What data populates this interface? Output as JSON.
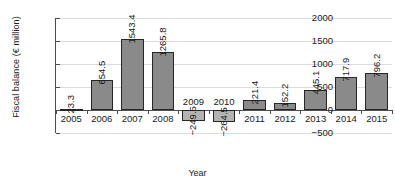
{
  "chart_data": {
    "type": "bar",
    "title": "",
    "xlabel": "Year",
    "ylabel": "Fiscal balance (€ million)",
    "categories": [
      "2005",
      "2006",
      "2007",
      "2008",
      "2009",
      "2010",
      "2011",
      "2012",
      "2013",
      "2014",
      "2015"
    ],
    "values": [
      23.3,
      654.5,
      1543.4,
      1265.8,
      -249.5,
      -264.5,
      221.4,
      152.2,
      445.1,
      717.9,
      796.2
    ],
    "value_labels": [
      "23.3",
      "654.5",
      "1543.4",
      "1265.8",
      "−249.5",
      "−264.5",
      "221.4",
      "152.2",
      "445.1",
      "717.9",
      "796.2"
    ],
    "ylim": [
      -500,
      2000
    ],
    "yticks": [
      2000,
      1500,
      1000,
      500,
      0,
      -500
    ],
    "ytick_labels": [
      "2000",
      "1500",
      "1000",
      "500",
      "0",
      "−500"
    ],
    "grid": true,
    "legend": "none",
    "series": [
      {
        "name": "Fiscal balance",
        "values": [
          23.3,
          654.5,
          1543.4,
          1265.8,
          -249.5,
          -264.5,
          221.4,
          152.2,
          445.1,
          717.9,
          796.2
        ]
      }
    ],
    "colors": {
      "positive_bar": "#8a8a8a",
      "negative_bar": "#b3b3b3",
      "bar_border": "#262626",
      "axis": "#4d4d4d",
      "gridline": "#dcdcdc",
      "text": "#1a1a1a",
      "background": "#ffffff"
    }
  }
}
